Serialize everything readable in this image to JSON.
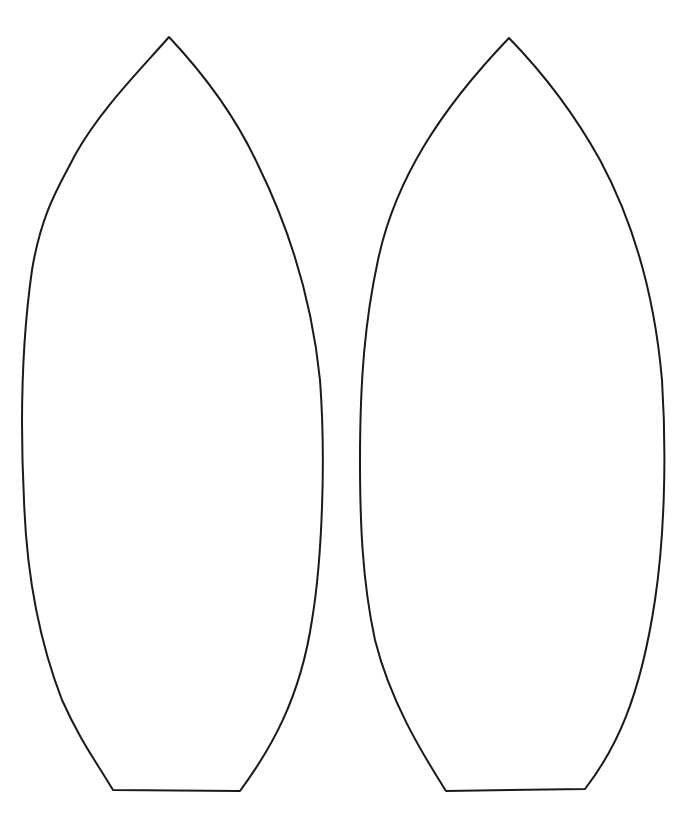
{
  "stroke_color": "#1a1a1a",
  "background_color": "#ffffff",
  "shapes": [
    {
      "label": "left-shape"
    },
    {
      "label": "right-shape"
    }
  ]
}
